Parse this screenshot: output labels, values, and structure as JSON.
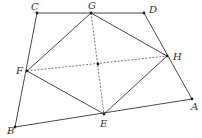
{
  "diagram": {
    "type": "geometry",
    "points": [
      {
        "name": "C",
        "x": 37,
        "y": 13,
        "label_x": 31,
        "label_y": 10
      },
      {
        "name": "G",
        "x": 91,
        "y": 13,
        "label_x": 88,
        "label_y": 9
      },
      {
        "name": "D",
        "x": 144,
        "y": 13,
        "label_x": 149,
        "label_y": 13
      },
      {
        "name": "F",
        "x": 27,
        "y": 71,
        "label_x": 16,
        "label_y": 74
      },
      {
        "name": "H",
        "x": 167,
        "y": 56,
        "label_x": 173,
        "label_y": 60
      },
      {
        "name": "O",
        "x": 98,
        "y": 64,
        "label_x": null,
        "label_y": null
      },
      {
        "name": "E",
        "x": 104,
        "y": 114,
        "label_x": 100,
        "label_y": 127
      },
      {
        "name": "A",
        "x": 192,
        "y": 99,
        "label_x": 191,
        "label_y": 110
      },
      {
        "name": "B",
        "x": 15,
        "y": 127,
        "label_x": 7,
        "label_y": 134
      }
    ],
    "labels": {
      "C": "C",
      "G": "G",
      "D": "D",
      "F": "F",
      "H": "H",
      "E": "E",
      "A": "A",
      "B": "B"
    },
    "solid_segments": [
      [
        "C",
        "D"
      ],
      [
        "C",
        "B"
      ],
      [
        "D",
        "A"
      ],
      [
        "A",
        "B"
      ],
      [
        "G",
        "F"
      ],
      [
        "G",
        "H"
      ],
      [
        "F",
        "E"
      ],
      [
        "E",
        "H"
      ]
    ],
    "dashed_segments": [
      [
        "G",
        "E"
      ],
      [
        "F",
        "H"
      ]
    ]
  }
}
